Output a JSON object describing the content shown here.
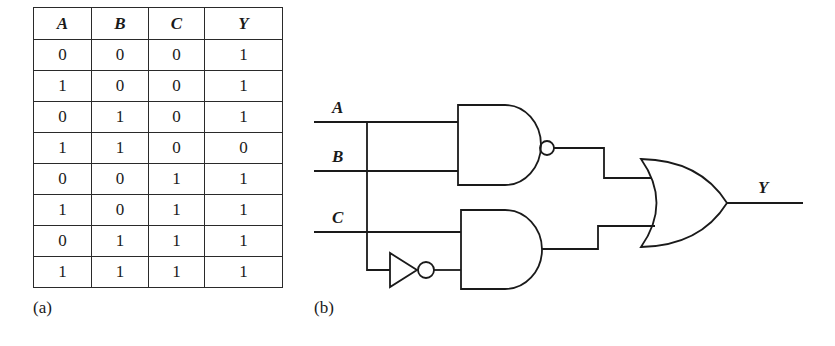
{
  "truth_table": {
    "headers": [
      "A",
      "B",
      "C",
      "Y"
    ],
    "rows": [
      [
        "0",
        "0",
        "0",
        "1"
      ],
      [
        "1",
        "0",
        "0",
        "1"
      ],
      [
        "0",
        "1",
        "0",
        "1"
      ],
      [
        "1",
        "1",
        "0",
        "0"
      ],
      [
        "0",
        "0",
        "1",
        "1"
      ],
      [
        "1",
        "0",
        "1",
        "1"
      ],
      [
        "0",
        "1",
        "1",
        "1"
      ],
      [
        "1",
        "1",
        "1",
        "1"
      ]
    ],
    "caption": "(a)"
  },
  "circuit": {
    "caption": "(b)",
    "inputs": [
      "A",
      "B",
      "C"
    ],
    "output": "Y",
    "gates": [
      "NAND(A,B)",
      "NOT(A)",
      "AND(C, NOT A)",
      "OR"
    ]
  }
}
